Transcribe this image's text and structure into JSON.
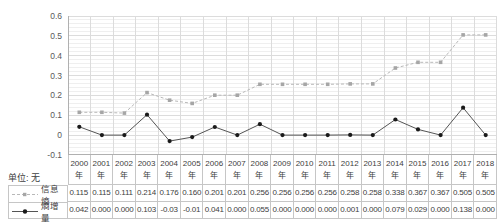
{
  "unit_label": "单位: 无",
  "chart_data": {
    "type": "line",
    "title": "",
    "xlabel": "",
    "ylabel": "",
    "ylim": [
      -0.1,
      0.6
    ],
    "yticks": [
      "0.6",
      "0.5",
      "0.4",
      "0.3",
      "0.2",
      "0.1",
      "0",
      "-0.1"
    ],
    "grid": "major-and-minor",
    "minor_y_step": 0.02,
    "legend_position": "left-of-table-rows",
    "year_suffix": "年",
    "years": [
      "2000",
      "2001",
      "2002",
      "2003",
      "2004",
      "2005",
      "2006",
      "2007",
      "2008",
      "2009",
      "2010",
      "2011",
      "2012",
      "2013",
      "2014",
      "2015",
      "2016",
      "2017",
      "2018"
    ],
    "series": [
      {
        "name": "信息熵",
        "marker": "square",
        "line_style": "dashed",
        "line_color": "#b8b8b8",
        "marker_color": "#a6a6a6",
        "values": [
          0.115,
          0.115,
          0.111,
          0.214,
          0.176,
          0.16,
          0.201,
          0.201,
          0.256,
          0.256,
          0.256,
          0.256,
          0.258,
          0.258,
          0.338,
          0.367,
          0.367,
          0.505,
          0.505
        ],
        "display_values": [
          "0.115",
          "0.115",
          "0.111",
          "0.214",
          "0.176",
          "0.160",
          "0.201",
          "0.201",
          "0.256",
          "0.256",
          "0.256",
          "0.256",
          "0.258",
          "0.258",
          "0.338",
          "0.367",
          "0.367",
          "0.505",
          "0.505"
        ]
      },
      {
        "name": "熵增量",
        "marker": "circle",
        "line_style": "solid",
        "line_color": "#555555",
        "marker_color": "#1a1a1a",
        "values": [
          0.042,
          0.0,
          0.0,
          0.103,
          -0.03,
          -0.01,
          0.041,
          0.0,
          0.055,
          0.0,
          0.0,
          0.0,
          0.001,
          0.0,
          0.079,
          0.029,
          0.0,
          0.138,
          0.0
        ],
        "display_values": [
          "0.042",
          "0.000",
          "0.000",
          "0.103",
          "-0.03",
          "-0.01",
          "0.041",
          "0.000",
          "0.055",
          "0.000",
          "0.000",
          "0.000",
          "0.001",
          "0.000",
          "0.079",
          "0.029",
          "0.000",
          "0.138",
          "0.000"
        ]
      }
    ],
    "grid_color_minor": "#efefef",
    "grid_color_major": "#dcdcdc",
    "axis_color": "#b0b0b0"
  }
}
